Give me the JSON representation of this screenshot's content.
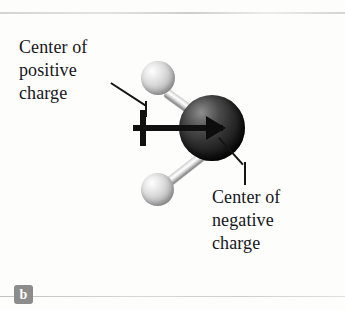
{
  "figure": {
    "panel_letter": "b",
    "labels": {
      "positive": "Center of\npositive\ncharge",
      "negative": "Center of\nnegative\ncharge"
    },
    "colors": {
      "background": "#fdfdfc",
      "text": "#16161a",
      "leader_line": "#151515",
      "dipole_arrow": "#0d0d0d",
      "atom_dark": "#1a1a1a",
      "atom_light": "#dcdcdc",
      "panel_badge": "#8c8c8c",
      "rule": "#cdcdcd"
    },
    "icons": {
      "dipole_arrow": "dipole-arrow-icon",
      "plus_sign": "plus-sign-icon"
    }
  }
}
